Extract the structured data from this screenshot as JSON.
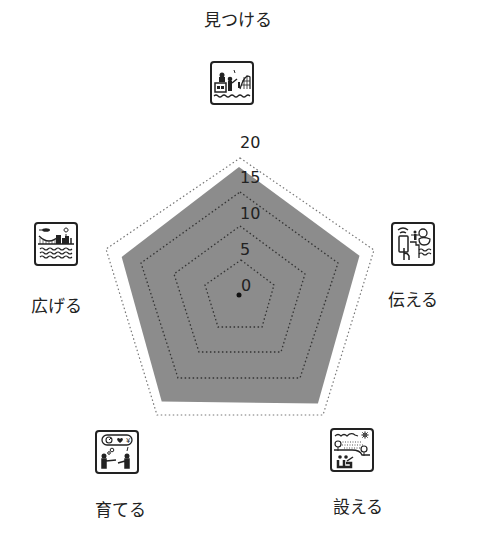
{
  "chart_data": {
    "type": "radar",
    "title": "",
    "axes": [
      "見つける",
      "伝える",
      "設える",
      "育てる",
      "広げる"
    ],
    "series": [
      {
        "name": "score",
        "values": [
          18.7,
          18.5,
          19.6,
          19.2,
          18.0
        ],
        "fill": "#8c8c8c"
      }
    ],
    "rlim": [
      0,
      20
    ],
    "rticks": [
      "0",
      "5",
      "10",
      "15",
      "20"
    ],
    "grid": "dotted pentagons"
  },
  "labels": {
    "top": "見つける",
    "right": "伝える",
    "bottom_right": "設える",
    "bottom_left": "育てる",
    "left": "広げる"
  },
  "ticks": {
    "t0": "0",
    "t5": "5",
    "t10": "10",
    "t15": "15",
    "t20": "20"
  },
  "icons": {
    "top": "discover-icon",
    "right": "communicate-icon",
    "bottom_right": "arrange-icon",
    "bottom_left": "nurture-icon",
    "left": "expand-icon"
  },
  "colors": {
    "fill": "#8c8c8c",
    "grid": "#444444",
    "outer_grid": "#777777"
  }
}
